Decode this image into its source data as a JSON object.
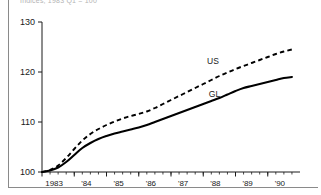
{
  "figure": {
    "caption_clipped": "Indices, 1983 Q1 = 100",
    "border_color": "#8a8a8a"
  },
  "chart_data": {
    "type": "line",
    "title": "",
    "xlabel": "",
    "ylabel": "",
    "xlim": [
      1982.75,
      1990.75
    ],
    "ylim": [
      100,
      130
    ],
    "yticks": [
      100,
      110,
      120,
      130
    ],
    "ytick_labels": [
      "100",
      "110",
      "120",
      "130"
    ],
    "xticks": [
      1983,
      1984,
      1985,
      1986,
      1987,
      1988,
      1989,
      1990
    ],
    "xtick_labels": [
      "1983",
      "'84",
      "'85",
      "'86",
      "'87",
      "'88",
      "'89",
      "'90"
    ],
    "minor_tick_interval": 0.25,
    "grid": false,
    "legend_position": "inline-annotation",
    "series": [
      {
        "name": "US",
        "label": "US",
        "style": "dashed",
        "color": "#000000",
        "label_x": 1988.05,
        "label_y": 121.6,
        "x": [
          1982.75,
          1983.0,
          1983.25,
          1983.5,
          1983.75,
          1984.0,
          1984.25,
          1984.5,
          1984.75,
          1985.0,
          1985.25,
          1985.5,
          1985.75,
          1986.0,
          1986.25,
          1986.5,
          1986.75,
          1987.0,
          1987.25,
          1987.5,
          1987.75,
          1988.0,
          1988.25,
          1988.5,
          1988.75,
          1989.0,
          1989.25,
          1989.5,
          1989.75,
          1990.0,
          1990.25,
          1990.5
        ],
        "values": [
          100.0,
          100.4,
          101.3,
          102.8,
          104.6,
          106.3,
          107.6,
          108.6,
          109.4,
          110.1,
          110.7,
          111.2,
          111.6,
          112.1,
          112.8,
          113.6,
          114.4,
          115.2,
          116.0,
          116.8,
          117.6,
          118.4,
          119.2,
          119.9,
          120.6,
          121.2,
          121.8,
          122.4,
          123.0,
          123.6,
          124.1,
          124.5
        ]
      },
      {
        "name": "GL",
        "label": "GL",
        "style": "solid",
        "color": "#000000",
        "label_x": 1988.1,
        "label_y": 115.0,
        "x": [
          1982.75,
          1983.0,
          1983.25,
          1983.5,
          1983.75,
          1984.0,
          1984.25,
          1984.5,
          1984.75,
          1985.0,
          1985.25,
          1985.5,
          1985.75,
          1986.0,
          1986.25,
          1986.5,
          1986.75,
          1987.0,
          1987.25,
          1987.5,
          1987.75,
          1988.0,
          1988.25,
          1988.5,
          1988.75,
          1989.0,
          1989.25,
          1989.5,
          1989.75,
          1990.0,
          1990.25,
          1990.5
        ],
        "values": [
          100.0,
          100.3,
          100.9,
          102.0,
          103.4,
          104.8,
          105.8,
          106.6,
          107.2,
          107.7,
          108.1,
          108.5,
          108.9,
          109.4,
          110.0,
          110.6,
          111.2,
          111.8,
          112.4,
          113.0,
          113.6,
          114.2,
          114.8,
          115.5,
          116.2,
          116.8,
          117.2,
          117.6,
          118.0,
          118.4,
          118.8,
          119.0
        ]
      }
    ]
  }
}
